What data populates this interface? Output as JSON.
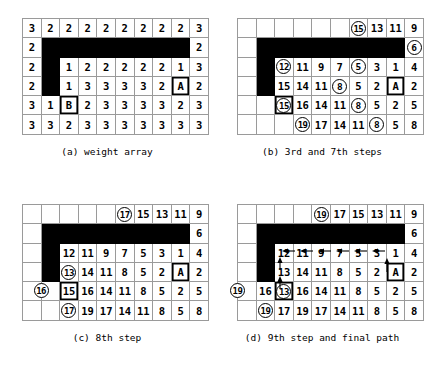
{
  "figure": {
    "panels": [
      {
        "id": "a",
        "caption": "(a) weight array",
        "rows": [
          [
            {
              "v": "3"
            },
            {
              "v": "2"
            },
            {
              "v": "2"
            },
            {
              "v": "2"
            },
            {
              "v": "2"
            },
            {
              "v": "2"
            },
            {
              "v": "2"
            },
            {
              "v": "2"
            },
            {
              "v": "2"
            },
            {
              "v": "3"
            }
          ],
          [
            {
              "v": "2"
            },
            {
              "b": 1
            },
            {
              "b": 1
            },
            {
              "b": 1
            },
            {
              "b": 1
            },
            {
              "b": 1
            },
            {
              "b": 1
            },
            {
              "b": 1
            },
            {
              "b": 1
            },
            {
              "v": "2"
            }
          ],
          [
            {
              "v": "2"
            },
            {
              "b": 1
            },
            {
              "v": "1"
            },
            {
              "v": "2"
            },
            {
              "v": "2"
            },
            {
              "v": "2"
            },
            {
              "v": "2"
            },
            {
              "v": "2"
            },
            {
              "v": "1"
            },
            {
              "v": "3"
            }
          ],
          [
            {
              "v": "2"
            },
            {
              "b": 1
            },
            {
              "v": "1"
            },
            {
              "v": "3"
            },
            {
              "v": "3"
            },
            {
              "v": "3"
            },
            {
              "v": "3"
            },
            {
              "v": "2"
            },
            {
              "v": "A",
              "t": 1
            },
            {
              "v": "2"
            }
          ],
          [
            {
              "v": "3"
            },
            {
              "v": "1"
            },
            {
              "v": "B",
              "t": 1
            },
            {
              "v": "2"
            },
            {
              "v": "3"
            },
            {
              "v": "3"
            },
            {
              "v": "3"
            },
            {
              "v": "3"
            },
            {
              "v": "2"
            },
            {
              "v": "3"
            }
          ],
          [
            {
              "v": "3"
            },
            {
              "v": "3"
            },
            {
              "v": "2"
            },
            {
              "v": "3"
            },
            {
              "v": "3"
            },
            {
              "v": "3"
            },
            {
              "v": "3"
            },
            {
              "v": "3"
            },
            {
              "v": "3"
            },
            {
              "v": "3"
            }
          ]
        ]
      },
      {
        "id": "b",
        "caption": "(b) 3rd and 7th steps",
        "rows": [
          [
            {
              "e": 1
            },
            {
              "e": 1
            },
            {
              "e": 1
            },
            {
              "e": 1
            },
            {
              "e": 1
            },
            {
              "e": 1
            },
            {
              "v": "15",
              "c": 1
            },
            {
              "v": "13"
            },
            {
              "v": "11"
            },
            {
              "v": "9"
            }
          ],
          [
            {
              "e": 1
            },
            {
              "b": 1
            },
            {
              "b": 1
            },
            {
              "b": 1
            },
            {
              "b": 1
            },
            {
              "b": 1
            },
            {
              "b": 1
            },
            {
              "b": 1
            },
            {
              "b": 1
            },
            {
              "v": "6",
              "c": 1
            }
          ],
          [
            {
              "e": 1
            },
            {
              "b": 1
            },
            {
              "v": "12",
              "c": 1
            },
            {
              "v": "11"
            },
            {
              "v": "9"
            },
            {
              "v": "7"
            },
            {
              "v": "5",
              "c": 1
            },
            {
              "v": "3"
            },
            {
              "v": "1"
            },
            {
              "v": "4"
            }
          ],
          [
            {
              "e": 1
            },
            {
              "b": 1
            },
            {
              "v": "15"
            },
            {
              "v": "14"
            },
            {
              "v": "11"
            },
            {
              "v": "8",
              "c": 1
            },
            {
              "v": "5"
            },
            {
              "v": "2"
            },
            {
              "v": "A",
              "t": 1
            },
            {
              "v": "2"
            }
          ],
          [
            {
              "e": 1
            },
            {
              "e": 1
            },
            {
              "v": "15",
              "c": 1,
              "t": 1
            },
            {
              "v": "16"
            },
            {
              "v": "14"
            },
            {
              "v": "11"
            },
            {
              "v": "8",
              "c": 1
            },
            {
              "v": "5"
            },
            {
              "v": "2"
            },
            {
              "v": "5"
            }
          ],
          [
            {
              "e": 1
            },
            {
              "e": 1
            },
            {
              "e": 1
            },
            {
              "v": "19",
              "c": 1
            },
            {
              "v": "17"
            },
            {
              "v": "14"
            },
            {
              "v": "11"
            },
            {
              "v": "8",
              "c": 1
            },
            {
              "v": "5"
            },
            {
              "v": "8"
            }
          ]
        ]
      },
      {
        "id": "c",
        "caption": "(c) 8th step",
        "rows": [
          [
            {
              "e": 1
            },
            {
              "e": 1
            },
            {
              "e": 1
            },
            {
              "e": 1
            },
            {
              "e": 1
            },
            {
              "v": "17",
              "c": 1
            },
            {
              "v": "15"
            },
            {
              "v": "13"
            },
            {
              "v": "11"
            },
            {
              "v": "9"
            }
          ],
          [
            {
              "e": 1
            },
            {
              "b": 1
            },
            {
              "b": 1
            },
            {
              "b": 1
            },
            {
              "b": 1
            },
            {
              "b": 1
            },
            {
              "b": 1
            },
            {
              "b": 1
            },
            {
              "b": 1
            },
            {
              "v": "6"
            }
          ],
          [
            {
              "e": 1
            },
            {
              "b": 1
            },
            {
              "v": "12"
            },
            {
              "v": "11"
            },
            {
              "v": "9"
            },
            {
              "v": "7"
            },
            {
              "v": "5"
            },
            {
              "v": "3"
            },
            {
              "v": "1"
            },
            {
              "v": "4"
            }
          ],
          [
            {
              "e": 1
            },
            {
              "b": 1
            },
            {
              "v": "13",
              "c": 1
            },
            {
              "v": "14"
            },
            {
              "v": "11"
            },
            {
              "v": "8"
            },
            {
              "v": "5"
            },
            {
              "v": "2"
            },
            {
              "v": "A",
              "t": 1
            },
            {
              "v": "2"
            }
          ],
          [
            {
              "e": 1
            },
            {
              "v": "16",
              "c": 1,
              "ovl": 1
            },
            {
              "v": "15",
              "t": 1
            },
            {
              "v": "16"
            },
            {
              "v": "14"
            },
            {
              "v": "11"
            },
            {
              "v": "8"
            },
            {
              "v": "5"
            },
            {
              "v": "2"
            },
            {
              "v": "5"
            }
          ],
          [
            {
              "e": 1
            },
            {
              "e": 1
            },
            {
              "v": "17",
              "c": 1
            },
            {
              "v": "19"
            },
            {
              "v": "17"
            },
            {
              "v": "14"
            },
            {
              "v": "11"
            },
            {
              "v": "8"
            },
            {
              "v": "5"
            },
            {
              "v": "8"
            }
          ]
        ]
      },
      {
        "id": "d",
        "caption": "(d) 9th step and final path",
        "rows": [
          [
            {
              "e": 1
            },
            {
              "e": 1
            },
            {
              "e": 1
            },
            {
              "e": 1
            },
            {
              "v": "19",
              "c": 1
            },
            {
              "v": "17"
            },
            {
              "v": "15"
            },
            {
              "v": "13"
            },
            {
              "v": "11"
            },
            {
              "v": "9"
            }
          ],
          [
            {
              "e": 1
            },
            {
              "b": 1
            },
            {
              "b": 1
            },
            {
              "b": 1
            },
            {
              "b": 1
            },
            {
              "b": 1
            },
            {
              "b": 1
            },
            {
              "b": 1
            },
            {
              "b": 1
            },
            {
              "v": "6"
            }
          ],
          [
            {
              "e": 1
            },
            {
              "b": 1
            },
            {
              "v": "12"
            },
            {
              "v": "11"
            },
            {
              "v": "9"
            },
            {
              "v": "7"
            },
            {
              "v": "5"
            },
            {
              "v": "3"
            },
            {
              "v": "1"
            },
            {
              "v": "4"
            }
          ],
          [
            {
              "e": 1
            },
            {
              "b": 1
            },
            {
              "v": "13"
            },
            {
              "v": "14"
            },
            {
              "v": "11"
            },
            {
              "v": "8"
            },
            {
              "v": "5"
            },
            {
              "v": "2"
            },
            {
              "v": "A",
              "t": 1
            },
            {
              "v": "2"
            }
          ],
          [
            {
              "v": "19",
              "c": 1,
              "ovl": 1
            },
            {
              "v": "16"
            },
            {
              "v": "13",
              "c": 1,
              "t": 1
            },
            {
              "v": "16"
            },
            {
              "v": "14"
            },
            {
              "v": "11"
            },
            {
              "v": "8"
            },
            {
              "v": "5"
            },
            {
              "v": "2"
            },
            {
              "v": "5"
            }
          ],
          [
            {
              "e": 1
            },
            {
              "v": "19",
              "c": 1
            },
            {
              "v": "17"
            },
            {
              "v": "19"
            },
            {
              "v": "17"
            },
            {
              "v": "14"
            },
            {
              "v": "11"
            },
            {
              "v": "8"
            },
            {
              "v": "5"
            },
            {
              "v": "8"
            }
          ]
        ],
        "path_arrows": "final path arrows: up from A to 1, left along 1-3-5-7-9-11-12, up from 13 to 12"
      }
    ]
  }
}
